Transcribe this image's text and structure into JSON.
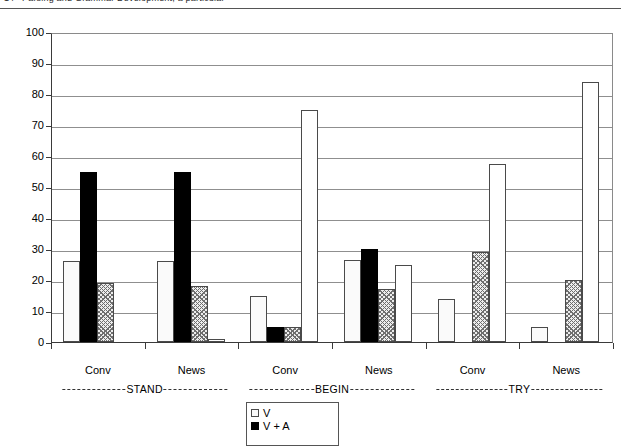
{
  "header": {
    "page_number": "14",
    "running_title": "Parsing and Grammar Development, a particular"
  },
  "chart_data": {
    "type": "bar",
    "title": "",
    "xlabel": "",
    "ylabel": "",
    "ylim": [
      0,
      100
    ],
    "ytick_step": 10,
    "yticks": [
      "0",
      "10",
      "20",
      "30",
      "40",
      "50",
      "60",
      "70",
      "80",
      "90",
      "100"
    ],
    "grid": true,
    "legend_position": "bottom-center",
    "groups": [
      {
        "name": "STAND",
        "subgroups": [
          {
            "label": "Conv",
            "values": [
              26,
              55,
              19,
              0
            ]
          },
          {
            "label": "News",
            "values": [
              26,
              55,
              18,
              1
            ]
          }
        ]
      },
      {
        "name": "BEGIN",
        "subgroups": [
          {
            "label": "Conv",
            "values": [
              15,
              5,
              5,
              75
            ]
          },
          {
            "label": "News",
            "values": [
              26.5,
              30,
              17,
              25
            ]
          }
        ]
      },
      {
        "name": "TRY",
        "subgroups": [
          {
            "label": "Conv",
            "values": [
              14,
              0,
              29,
              57.5
            ]
          },
          {
            "label": "News",
            "values": [
              5,
              0,
              20,
              84
            ]
          }
        ]
      }
    ],
    "categories": [
      "STAND Conv",
      "STAND News",
      "BEGIN Conv",
      "BEGIN News",
      "TRY Conv",
      "TRY News"
    ],
    "series": [
      {
        "name": "V",
        "style": "dotted",
        "values": [
          26,
          26,
          15,
          26.5,
          14,
          5
        ]
      },
      {
        "name": "V + A",
        "style": "solid-black",
        "values": [
          55,
          55,
          5,
          30,
          0,
          0
        ]
      },
      {
        "name": "A",
        "style": "hatched",
        "values": [
          19,
          18,
          5,
          17,
          29,
          20
        ]
      },
      {
        "name": "none",
        "style": "white",
        "values": [
          0,
          1,
          75,
          25,
          57.5,
          84
        ]
      }
    ]
  },
  "legend": {
    "entries": [
      {
        "label": "V",
        "style": "v"
      },
      {
        "label": "V + A",
        "style": "va"
      }
    ]
  }
}
